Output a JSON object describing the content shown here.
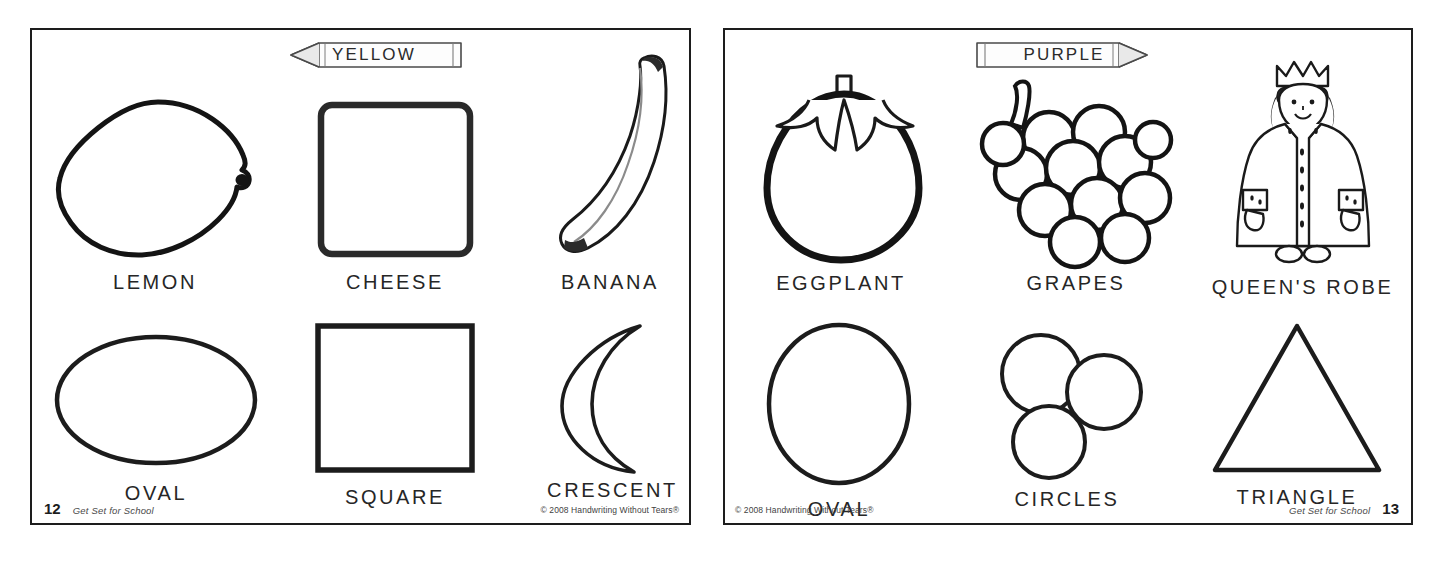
{
  "document": {
    "type": "coloring-workbook-spread",
    "ink_color": "#1d1d1d",
    "paper_color": "#ffffff"
  },
  "left_page": {
    "crayon": {
      "label": "YELLOW",
      "direction": "left",
      "icon": "crayon-icon"
    },
    "page_number": "12",
    "brand": "Get Set for School",
    "copyright": "© 2008 Handwriting Without Tears®",
    "items": [
      {
        "caption": "LEMON",
        "art": "lemon-drawing"
      },
      {
        "caption": "CHEESE",
        "art": "cheese-drawing"
      },
      {
        "caption": "BANANA",
        "art": "banana-drawing"
      },
      {
        "caption": "OVAL",
        "art": "oval-horizontal-shape"
      },
      {
        "caption": "SQUARE",
        "art": "square-shape"
      },
      {
        "caption": "CRESCENT",
        "art": "crescent-shape"
      }
    ]
  },
  "right_page": {
    "crayon": {
      "label": "PURPLE",
      "direction": "right",
      "icon": "crayon-icon"
    },
    "page_number": "13",
    "brand": "Get Set for School",
    "copyright": "© 2008 Handwriting Without Tears®",
    "items": [
      {
        "caption": "EGGPLANT",
        "art": "eggplant-drawing"
      },
      {
        "caption": "GRAPES",
        "art": "grapes-drawing"
      },
      {
        "caption": "QUEEN'S ROBE",
        "art": "queens-robe-drawing"
      },
      {
        "caption": "OVAL",
        "art": "oval-vertical-shape"
      },
      {
        "caption": "CIRCLES",
        "art": "three-circles-shape"
      },
      {
        "caption": "TRIANGLE",
        "art": "triangle-shape"
      }
    ]
  }
}
